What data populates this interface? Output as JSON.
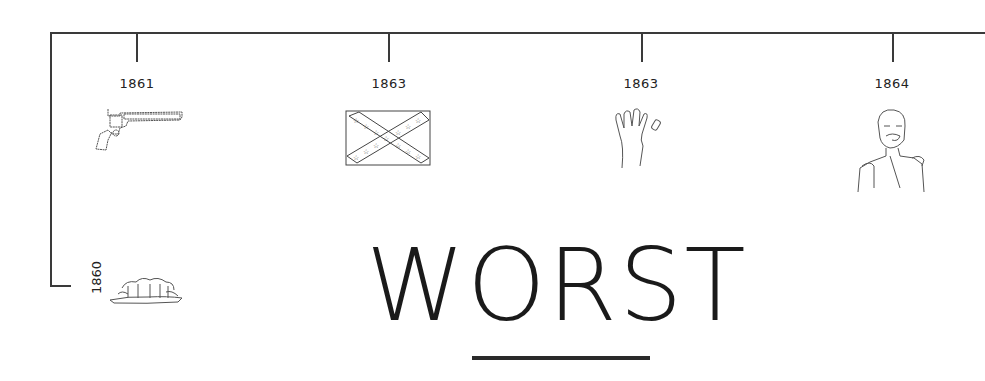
{
  "timeline": {
    "start_year": "1860",
    "events": [
      {
        "year": "1861",
        "icon": "revolver-icon"
      },
      {
        "year": "1863",
        "icon": "confederate-flag-icon"
      },
      {
        "year": "1863",
        "icon": "hand-missing-finger-icon"
      },
      {
        "year": "1864",
        "icon": "general-portrait-icon"
      }
    ],
    "start_icon": "trees-island-icon"
  },
  "heading": {
    "title": "WORST"
  }
}
